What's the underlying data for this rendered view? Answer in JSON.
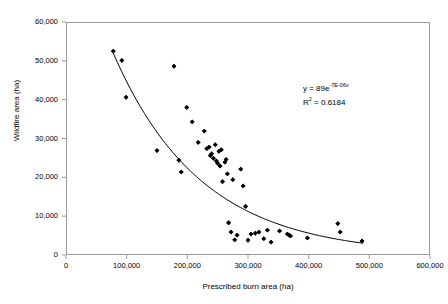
{
  "chart_data": {
    "type": "scatter",
    "title": "",
    "xlabel": "Prescribed burn area (ha)",
    "ylabel": "Wildfire area (ha)",
    "xlim": [
      0,
      600000
    ],
    "ylim": [
      0,
      60000
    ],
    "xticks": [
      0,
      100000,
      200000,
      300000,
      400000,
      500000,
      600000
    ],
    "yticks": [
      0,
      10000,
      20000,
      30000,
      40000,
      50000,
      60000
    ],
    "xticklabels": [
      "0",
      "100,000",
      "200,000",
      "300,000",
      "400,000",
      "500,000",
      "600,000"
    ],
    "yticklabels": [
      "0",
      "10,000",
      "20,000",
      "30,000",
      "40,000",
      "50,000",
      "60,000"
    ],
    "grid": false,
    "legend": null,
    "marker": "diamond",
    "marker_color": "#000000",
    "points": [
      [
        78000,
        52500
      ],
      [
        92000,
        50100
      ],
      [
        99000,
        40600
      ],
      [
        150000,
        26900
      ],
      [
        178000,
        48600
      ],
      [
        186000,
        24400
      ],
      [
        190000,
        21400
      ],
      [
        199000,
        38000
      ],
      [
        208000,
        34300
      ],
      [
        218000,
        29000
      ],
      [
        228000,
        31900
      ],
      [
        232000,
        27400
      ],
      [
        236000,
        27800
      ],
      [
        238000,
        25600
      ],
      [
        240000,
        26100
      ],
      [
        243000,
        24900
      ],
      [
        246000,
        28400
      ],
      [
        248000,
        24200
      ],
      [
        250000,
        23600
      ],
      [
        252000,
        26700
      ],
      [
        254000,
        22900
      ],
      [
        256000,
        27100
      ],
      [
        258000,
        18900
      ],
      [
        262000,
        23900
      ],
      [
        264000,
        24600
      ],
      [
        266000,
        20900
      ],
      [
        268000,
        8300
      ],
      [
        272000,
        5900
      ],
      [
        275000,
        19400
      ],
      [
        278000,
        3900
      ],
      [
        282000,
        5100
      ],
      [
        288000,
        22100
      ],
      [
        292000,
        17800
      ],
      [
        296000,
        12500
      ],
      [
        300000,
        3800
      ],
      [
        305000,
        5400
      ],
      [
        312000,
        5600
      ],
      [
        318000,
        5900
      ],
      [
        326000,
        4200
      ],
      [
        332000,
        6400
      ],
      [
        338000,
        3300
      ],
      [
        352000,
        6200
      ],
      [
        365000,
        5400
      ],
      [
        368000,
        5100
      ],
      [
        370000,
        4900
      ],
      [
        398000,
        4400
      ],
      [
        448000,
        8100
      ],
      [
        452000,
        5900
      ],
      [
        488000,
        3600
      ]
    ],
    "trendline": {
      "type": "exponential",
      "equation_prefix": "y = 89e",
      "equation_exponent": "-7E-06x",
      "r_squared_label": "R",
      "r_squared_sup": "2",
      "r_squared_value": " = 0.6184",
      "a": 89000,
      "b": -6.9e-06,
      "x_start": 78000,
      "x_end": 490000,
      "color": "#000000"
    }
  }
}
